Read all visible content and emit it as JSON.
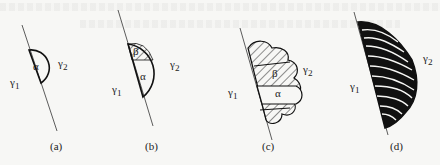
{
  "figure": {
    "panels": [
      {
        "id": "a",
        "caption": "(a)",
        "gamma1": "γ1",
        "gamma2": "γ2",
        "phases": [
          "α"
        ]
      },
      {
        "id": "b",
        "caption": "(b)",
        "gamma1": "γ1",
        "gamma2": "γ2",
        "phases": [
          "β",
          "α"
        ]
      },
      {
        "id": "c",
        "caption": "(c)",
        "gamma1": "γ1",
        "gamma2": "γ2",
        "phases": [
          "β",
          "α"
        ]
      },
      {
        "id": "d",
        "caption": "(d)",
        "gamma1": "γ1",
        "gamma2": "γ2",
        "phases": []
      }
    ],
    "symbols": {
      "alpha": "α",
      "beta": "β",
      "gamma": "γ",
      "sub1": "1",
      "sub2": "2"
    }
  }
}
